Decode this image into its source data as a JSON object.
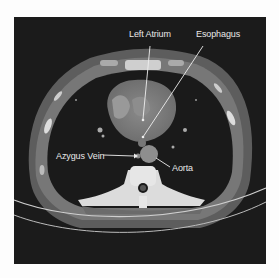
{
  "figure": {
    "type": "axial chest CT scan",
    "background": "#1b1b1b",
    "labels": [
      {
        "id": "left-atrium",
        "text": "Left Atrium"
      },
      {
        "id": "esophagus",
        "text": "Esophagus"
      },
      {
        "id": "azygus-vein",
        "text": "Azygus Vein"
      },
      {
        "id": "aorta",
        "text": "Aorta"
      }
    ]
  }
}
